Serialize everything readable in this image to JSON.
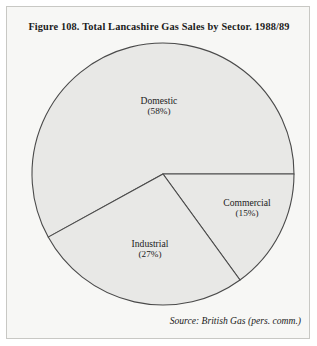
{
  "figure": {
    "title": "Figure 108.  Total Lancashire Gas Sales by Sector. 1988/89",
    "source": "Source: British Gas (pers. comm.)"
  },
  "chart_data": {
    "type": "pie",
    "title": "Figure 108.  Total Lancashire Gas Sales by Sector. 1988/89",
    "xlabel": "",
    "ylabel": "",
    "legend": "none",
    "grid": false,
    "categories": [
      "Domestic",
      "Commercial",
      "Industrial"
    ],
    "values": [
      58,
      15,
      27
    ],
    "unit": "%",
    "start_angle_deg": 0,
    "direction": "clockwise",
    "slices": [
      {
        "name": "Domestic",
        "label": "Domestic",
        "value": 58,
        "pct_label": "(58%)",
        "fill": "#e8e8e6",
        "stroke": "#4a4a4a",
        "start_deg": 151.2,
        "end_deg": 360.0
      },
      {
        "name": "Commercial",
        "label": "Commercial",
        "value": 15,
        "pct_label": "(15%)",
        "fill": "#e8e8e6",
        "stroke": "#4a4a4a",
        "start_deg": 0.0,
        "end_deg": 54.0
      },
      {
        "name": "Industrial",
        "label": "Industrial",
        "value": 27,
        "pct_label": "(27%)",
        "fill": "#e8e8e6",
        "stroke": "#4a4a4a",
        "start_deg": 54.0,
        "end_deg": 151.2
      }
    ],
    "geometry": {
      "center_x": 162,
      "center_y": 173,
      "radius": 131
    },
    "colors": {
      "slice_fill": "#e8e8e6",
      "slice_stroke": "#4a4a4a",
      "page_background": "#f7f7f5",
      "frame_border": "#c8c8c4",
      "text": "#1b1b1b"
    }
  }
}
